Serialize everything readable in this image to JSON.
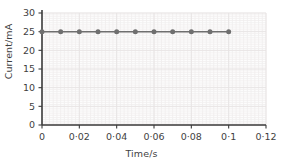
{
  "chart_data": {
    "type": "line",
    "title": "",
    "subtitle": "",
    "xlabel": "Time/s",
    "ylabel": "Current/mA",
    "x": [
      0,
      0.01,
      0.02,
      0.03,
      0.04,
      0.05,
      0.06,
      0.07,
      0.08,
      0.09,
      0.1
    ],
    "values": [
      25,
      25,
      25,
      25,
      25,
      25,
      25,
      25,
      25,
      25,
      25
    ],
    "series": [
      {
        "name": "Current",
        "values": [
          25,
          25,
          25,
          25,
          25,
          25,
          25,
          25,
          25,
          25,
          25
        ]
      }
    ],
    "xlim": [
      0,
      0.12
    ],
    "ylim": [
      0,
      30
    ],
    "xticks": [
      0,
      0.02,
      0.04,
      0.06,
      0.08,
      0.1,
      0.12
    ],
    "yticks": [
      0,
      5,
      10,
      15,
      20,
      25,
      30
    ],
    "xtick_labels": [
      "0",
      "0·02",
      "0·04",
      "0·06",
      "0·08",
      "0·1",
      "0·12"
    ],
    "ytick_labels": [
      "0",
      "5",
      "10",
      "15",
      "20",
      "25",
      "30"
    ],
    "grid": true,
    "grid_minor_step_x": 0.002,
    "grid_minor_step_y": 0.5,
    "legend": null,
    "legend_position": "none",
    "annotations": [],
    "colors": {
      "line": "#6f6f6f",
      "marker": "#6f6f6f",
      "axis": "#3c3c3c",
      "grid_minor": "#f0eeee",
      "grid_major": "#e6e3e3",
      "text": "#3f3f3f",
      "background": "#ffffff"
    }
  }
}
